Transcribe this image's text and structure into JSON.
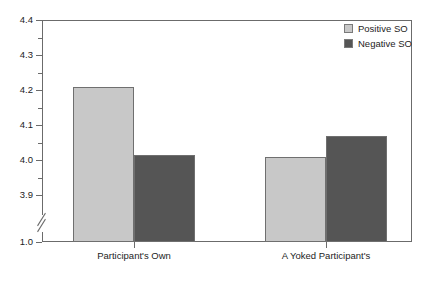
{
  "chart_data": {
    "type": "bar",
    "title": "",
    "xlabel": "",
    "ylabel": "",
    "categories": [
      "Participant's Own",
      "A Yoked Participant's"
    ],
    "series": [
      {
        "name": "Positive SO",
        "values": [
          4.21,
          4.01
        ],
        "color": "#c8c8c8"
      },
      {
        "name": "Negative SO",
        "values": [
          4.015,
          4.07
        ],
        "color": "#555555"
      }
    ],
    "ylim": [
      1.0,
      4.4
    ],
    "axis_break": {
      "present": true,
      "between": [
        1.0,
        3.9
      ]
    },
    "y_ticks_major": [
      "4.4",
      "4.3",
      "4.2",
      "4.1",
      "4.0",
      "3.9",
      "1.0"
    ],
    "y_tick_values": [
      4.4,
      4.3,
      4.2,
      4.1,
      4.0,
      3.9,
      1.0
    ],
    "y_minor_ticks": [
      4.35,
      4.25,
      4.15,
      4.05,
      3.95
    ],
    "grid": false,
    "legend_position": "top-right",
    "frame": true,
    "colors": {
      "positive_so": "#c8c8c8",
      "negative_so": "#555555",
      "axis": "#6b6b6b",
      "text": "#1d1d1d",
      "background": "#ffffff"
    }
  },
  "legend": {
    "items": [
      {
        "label": "Positive SO",
        "color": "#c8c8c8"
      },
      {
        "label": "Negative SO",
        "color": "#555555"
      }
    ]
  },
  "yaxis": {
    "ticks": [
      {
        "label": "4.4"
      },
      {
        "label": "4.3"
      },
      {
        "label": "4.2"
      },
      {
        "label": "4.1"
      },
      {
        "label": "4.0"
      },
      {
        "label": "3.9"
      },
      {
        "label": "1.0"
      }
    ]
  },
  "xaxis": {
    "labels": [
      "Participant's Own",
      "A Yoked Participant's"
    ]
  }
}
